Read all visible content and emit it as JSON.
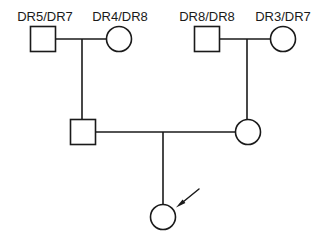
{
  "figure": {
    "type": "pedigree-chart",
    "width": 325,
    "height": 248,
    "background_color": "#ffffff",
    "line_color": "#1a1a1a",
    "symbol_fill": "#ffffff"
  },
  "labels": {
    "gen1_father_left": "DR5/DR7",
    "gen1_mother_left": "DR4/DR8",
    "gen1_father_right": "DR8/DR8",
    "gen1_mother_right": "DR3/DR7"
  },
  "individuals": [
    {
      "id": "I-1",
      "symbol": "square",
      "sex": "male",
      "affected": false,
      "generation": 1,
      "label": "DR5/DR7",
      "cx": 43,
      "cy": 39,
      "size": 25
    },
    {
      "id": "I-2",
      "symbol": "circle",
      "sex": "female",
      "affected": false,
      "generation": 1,
      "label": "DR4/DR8",
      "cx": 119,
      "cy": 39,
      "size": 25
    },
    {
      "id": "I-3",
      "symbol": "square",
      "sex": "male",
      "affected": false,
      "generation": 1,
      "label": "DR8/DR8",
      "cx": 207,
      "cy": 39,
      "size": 25
    },
    {
      "id": "I-4",
      "symbol": "circle",
      "sex": "female",
      "affected": false,
      "generation": 1,
      "label": "DR3/DR7",
      "cx": 283,
      "cy": 39,
      "size": 25
    },
    {
      "id": "II-1",
      "symbol": "square",
      "sex": "male",
      "affected": false,
      "generation": 2,
      "label": "",
      "cx": 83,
      "cy": 132,
      "size": 25
    },
    {
      "id": "II-2",
      "symbol": "circle",
      "sex": "female",
      "affected": false,
      "generation": 2,
      "label": "",
      "cx": 248,
      "cy": 132,
      "size": 25
    },
    {
      "id": "III-1",
      "symbol": "circle",
      "sex": "female",
      "affected": false,
      "generation": 3,
      "label": "",
      "proband": true,
      "cx": 163,
      "cy": 217,
      "size": 25
    }
  ],
  "connections": [
    {
      "name": "mating-line-left-couple",
      "x1": 56,
      "y1": 39,
      "x2": 107,
      "y2": 39
    },
    {
      "name": "descent-line-left-couple",
      "x1": 82,
      "y1": 39,
      "x2": 82,
      "y2": 120
    },
    {
      "name": "mating-line-right-couple",
      "x1": 220,
      "y1": 39,
      "x2": 271,
      "y2": 39
    },
    {
      "name": "descent-line-right-couple",
      "x1": 247,
      "y1": 39,
      "x2": 247,
      "y2": 120
    },
    {
      "name": "mating-line-gen2-couple",
      "x1": 95,
      "y1": 132,
      "x2": 236,
      "y2": 132
    },
    {
      "name": "descent-line-to-proband",
      "x1": 163,
      "y1": 132,
      "x2": 163,
      "y2": 205
    }
  ],
  "proband_arrow": {
    "name": "proband-arrow",
    "from_x": 199,
    "from_y": 189,
    "to_x": 177,
    "to_y": 207,
    "points_to": "III-1",
    "meaning": "proband"
  }
}
